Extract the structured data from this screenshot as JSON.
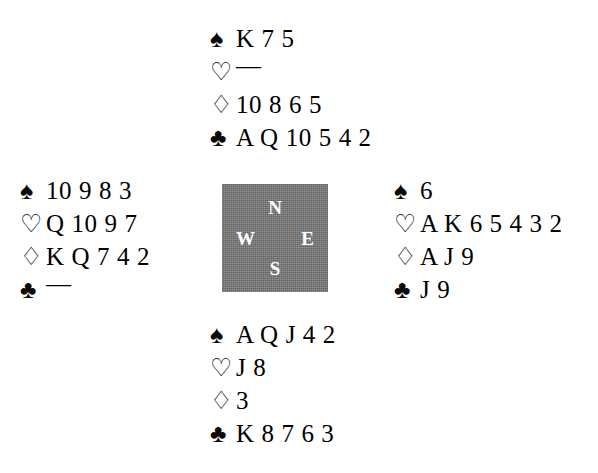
{
  "diagram": {
    "type": "bridge-hand-deal",
    "background_color": "#ffffff",
    "compass": {
      "box_color": "#787878",
      "letter_color": "#ffffff",
      "north": "N",
      "west": "W",
      "east": "E",
      "south": "S"
    },
    "suit_symbols": {
      "spade": "♠",
      "heart": "♡",
      "diamond": "♢",
      "club": "♣"
    },
    "void_marker": "—",
    "hands": {
      "north": {
        "label": "North",
        "spades": "K 7 5",
        "hearts": "—",
        "diamonds": "10 8 6 5",
        "clubs": "A Q 10 5 4 2"
      },
      "west": {
        "label": "West",
        "spades": "10 9 8 3",
        "hearts": "Q 10 9 7",
        "diamonds": "K Q 7 4 2",
        "clubs": "—"
      },
      "east": {
        "label": "East",
        "spades": "6",
        "hearts": "A K 6 5 4 3 2",
        "diamonds": "A J 9",
        "clubs": "J 9"
      },
      "south": {
        "label": "South",
        "spades": "A Q J 4 2",
        "hearts": "J 8",
        "diamonds": "3",
        "clubs": "K 8 7 6 3"
      }
    }
  }
}
